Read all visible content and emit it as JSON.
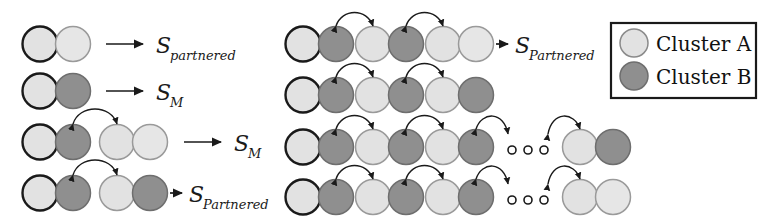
{
  "figure": {
    "title": "",
    "colors": {
      "cluster_a_fill": "#e2e2e2",
      "cluster_b_fill": "#8f8f8f",
      "node_stroke": "#4d4d4d",
      "node_stroke_bold": "#1a1a1a",
      "arrow": "#1a1a1a",
      "text": "#1a1a1a",
      "legend_border": "#1a1a1a",
      "background": "#ffffff"
    },
    "legend": {
      "name": "cluster-legend",
      "items": [
        {
          "swatch": "cluster-a-swatch",
          "cluster": "A",
          "label": "Cluster A",
          "fill_key": "cluster_a_fill"
        },
        {
          "swatch": "cluster-b-swatch",
          "cluster": "B",
          "label": "Cluster B",
          "fill_key": "cluster_b_fill"
        }
      ]
    },
    "left_block": {
      "name": "left-examples",
      "rows": [
        {
          "id": "left-row-1",
          "pairs": [
            {
              "nodes": [
                "A",
                "A"
              ]
            }
          ],
          "arcs": 0,
          "arrow": "straight-long",
          "label": "S",
          "label_sub": "partnered",
          "label_full": "S_partnered"
        },
        {
          "id": "left-row-2",
          "pairs": [
            {
              "nodes": [
                "A",
                "B"
              ]
            }
          ],
          "arcs": 0,
          "arrow": "straight-long",
          "label": "S",
          "label_sub": "M",
          "label_full": "S_M"
        },
        {
          "id": "left-row-3",
          "pairs": [
            {
              "nodes": [
                "A",
                "B"
              ]
            },
            {
              "nodes": [
                "A",
                "A"
              ]
            }
          ],
          "arcs": 1,
          "arrow": "straight-long",
          "label": "S",
          "label_sub": "M",
          "label_full": "S_M"
        },
        {
          "id": "left-row-4",
          "pairs": [
            {
              "nodes": [
                "A",
                "B"
              ]
            },
            {
              "nodes": [
                "A",
                "B"
              ]
            }
          ],
          "arcs": 1,
          "arrow": "short",
          "label": "S",
          "label_sub": "Partnered",
          "label_full": "S_Partnered"
        }
      ]
    },
    "right_block": {
      "name": "right-chains",
      "rows": [
        {
          "id": "right-row-1",
          "pairs": [
            {
              "nodes": [
                "A",
                "B"
              ]
            },
            {
              "nodes": [
                "A",
                "B"
              ]
            },
            {
              "nodes": [
                "A",
                "A"
              ]
            }
          ],
          "arcs": 2,
          "ellipsis": false,
          "arrow": "short",
          "label": "S",
          "label_sub": "Partnered",
          "label_full": "S_Partnered"
        },
        {
          "id": "right-row-2",
          "pairs": [
            {
              "nodes": [
                "A",
                "B"
              ]
            },
            {
              "nodes": [
                "A",
                "B"
              ]
            },
            {
              "nodes": [
                "A",
                "B"
              ]
            }
          ],
          "arcs": 2,
          "ellipsis": false,
          "arrow": "none",
          "label": "",
          "label_sub": "",
          "label_full": ""
        },
        {
          "id": "right-row-3",
          "pairs": [
            {
              "nodes": [
                "A",
                "B"
              ]
            },
            {
              "nodes": [
                "A",
                "B"
              ]
            },
            {
              "nodes": [
                "A",
                "B"
              ]
            },
            {
              "nodes": [
                "A",
                "B"
              ]
            }
          ],
          "arcs": 4,
          "ellipsis": true,
          "ellipsis_dots": 3,
          "arrow": "none",
          "label": "",
          "label_sub": "",
          "label_full": ""
        },
        {
          "id": "right-row-4",
          "pairs": [
            {
              "nodes": [
                "A",
                "B"
              ]
            },
            {
              "nodes": [
                "A",
                "B"
              ]
            },
            {
              "nodes": [
                "A",
                "B"
              ]
            },
            {
              "nodes": [
                "A",
                "A"
              ]
            }
          ],
          "arcs": 4,
          "ellipsis": true,
          "ellipsis_dots": 3,
          "arrow": "none",
          "label": "",
          "label_sub": "",
          "label_full": ""
        }
      ]
    }
  }
}
